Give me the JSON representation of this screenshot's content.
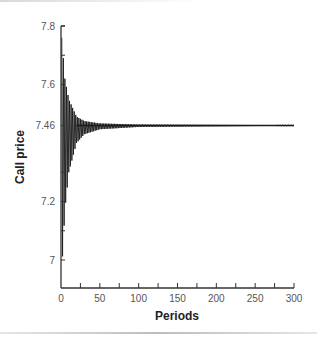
{
  "chart_data": {
    "type": "line",
    "title": "",
    "xlabel": "Periods",
    "ylabel": "Call price",
    "xlim": [
      0,
      300
    ],
    "ylim": [
      6.93,
      7.8
    ],
    "x_ticks": [
      0,
      50,
      100,
      150,
      200,
      250,
      300
    ],
    "x_tick_labels": [
      "0",
      "50",
      "100",
      "150",
      "200",
      "250",
      "300"
    ],
    "y_ticks": [
      7,
      7.2,
      7.46,
      7.6,
      7.8
    ],
    "y_tick_labels": [
      "7",
      "7.2",
      "7.46",
      "7.6",
      "7.8"
    ],
    "grid": false,
    "legend": null,
    "series": [
      {
        "name": "Binomial call price",
        "description": "Oscillating convergence toward 7.46 as number of periods increases",
        "converged_value": 7.46,
        "envelope_upper": [
          [
            1,
            7.76
          ],
          [
            5,
            7.62
          ],
          [
            10,
            7.55
          ],
          [
            20,
            7.49
          ],
          [
            30,
            7.475
          ],
          [
            50,
            7.467
          ],
          [
            100,
            7.463
          ],
          [
            300,
            7.461
          ]
        ],
        "envelope_lower": [
          [
            1,
            6.96
          ],
          [
            5,
            7.17
          ],
          [
            10,
            7.3
          ],
          [
            20,
            7.4
          ],
          [
            30,
            7.43
          ],
          [
            50,
            7.447
          ],
          [
            100,
            7.455
          ],
          [
            300,
            7.459
          ]
        ]
      }
    ],
    "color": "#1a1a1a"
  }
}
